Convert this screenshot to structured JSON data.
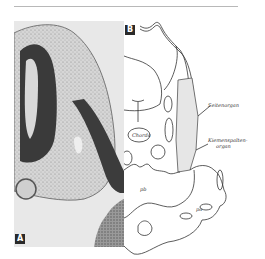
{
  "figure": {
    "panels": [
      {
        "id": "A",
        "label": "A",
        "type": "histology-photograph"
      },
      {
        "id": "B",
        "label": "B",
        "type": "line-drawing"
      }
    ],
    "panel_b_labels": {
      "seitenorgan": "Seitenorgan",
      "kiemenspaltenorgan_line1": "Kiemenspalten-",
      "kiemenspaltenorgan_line2": "organ",
      "chorda": "Chorda",
      "pb": "pb",
      "pa": "pa"
    }
  }
}
